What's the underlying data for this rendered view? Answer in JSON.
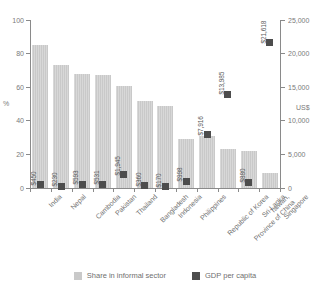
{
  "chart_data": {
    "type": "bar",
    "title": "",
    "subtitle": "",
    "xlabel": "",
    "ylabel": "%",
    "y2label": "US$",
    "ylim": [
      0,
      100
    ],
    "y2lim": [
      0,
      25000
    ],
    "grid": false,
    "legend_position": "bottom",
    "categories": [
      "India",
      "Nepal",
      "Cambodia",
      "Pakistan",
      "Thailand",
      "Bangladesh",
      "Indonesia",
      "Philippines",
      "Republic of Korea",
      "Taiwan, Province of China",
      "Sri Lanka",
      "Singapore"
    ],
    "left_ticks": [
      "0",
      "20",
      "40",
      "60",
      "80",
      "100"
    ],
    "left_tick_values": [
      0,
      20,
      40,
      60,
      80,
      100
    ],
    "right_ticks": [
      "0",
      "5,000",
      "10,000",
      "15,000",
      "20,000",
      "25,000"
    ],
    "right_tick_values": [
      0,
      5000,
      10000,
      15000,
      20000,
      25000
    ],
    "series": [
      {
        "name": "Share in informal sector",
        "type": "bar",
        "axis": "left",
        "unit": "%",
        "color": "#c9c9c9",
        "values": [
          85,
          73,
          68,
          67,
          61,
          52,
          49,
          29,
          31,
          23,
          22,
          9
        ]
      },
      {
        "name": "GDP per capita",
        "type": "scatter",
        "axis": "right",
        "unit": "US$",
        "color": "#4d4d4d",
        "values": [
          450,
          230,
          593,
          531,
          1945,
          360,
          170,
          998,
          7916,
          13985,
          880,
          21618
        ],
        "labels": [
          "$450",
          "$230",
          "$593",
          "$531",
          "$1,945",
          "$360",
          "$170",
          "$998",
          "$7,916",
          "$13,985",
          "$880",
          "$21,618"
        ]
      }
    ]
  },
  "legend": {
    "items": [
      {
        "label": "Share in informal sector",
        "color": "#c9c9c9"
      },
      {
        "label": "GDP per capita",
        "color": "#4d4d4d"
      }
    ]
  }
}
